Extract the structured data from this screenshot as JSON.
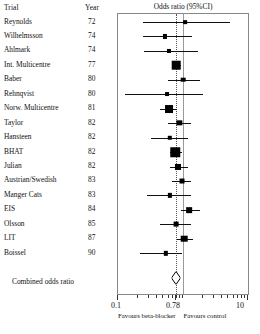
{
  "table": {
    "headers": {
      "trial": "Trial",
      "year": "Year"
    },
    "combined_label": "Combined odds ratio"
  },
  "plot": {
    "title": "Odds ratio  (95%CI)",
    "axis": {
      "scale": "log",
      "min": 0.1,
      "max": 10,
      "tick_labels": [
        "0.1",
        "0.78",
        "10"
      ],
      "tick_values": [
        0.1,
        0.78,
        10
      ],
      "null_line": 1.0,
      "pooled_line": 0.78
    },
    "footnotes": {
      "left": "Favours beta-blocker",
      "right": "Favours control"
    }
  },
  "chart_data": {
    "type": "scatter",
    "title": "Odds ratio  (95%CI)",
    "xlabel": "Odds ratio (95%CI)",
    "ylabel": "Trial",
    "xscale": "log",
    "xlim": [
      0.1,
      10
    ],
    "grid": false,
    "legend": null,
    "xticks": [
      0.1,
      0.78,
      10
    ],
    "xticklabels": [
      "0.1",
      "0.78",
      "10"
    ],
    "reference_lines": [
      {
        "value": 1.0,
        "style": "solid",
        "label": "no effect"
      },
      {
        "value": 0.78,
        "style": "dotted",
        "label": "pooled estimate"
      }
    ],
    "columns": [
      "Trial",
      "Year",
      "Odds ratio",
      "CI low",
      "CI high",
      "Weight"
    ],
    "rows": [
      {
        "trial": "Reynolds",
        "year": "72",
        "or": 1.09,
        "lo": 0.24,
        "hi": 5.2,
        "weight": 0.08
      },
      {
        "trial": "Wilhelmsson",
        "year": "74",
        "or": 0.52,
        "lo": 0.24,
        "hi": 1.4,
        "weight": 0.12
      },
      {
        "trial": "Ahlmark",
        "year": "74",
        "or": 0.6,
        "lo": 0.25,
        "hi": 1.7,
        "weight": 0.12
      },
      {
        "trial": "Int. Multicentre",
        "year": "77",
        "or": 0.78,
        "lo": 0.67,
        "hi": 0.92,
        "weight": 0.62
      },
      {
        "trial": "Baber",
        "year": "80",
        "or": 1.0,
        "lo": 0.58,
        "hi": 1.8,
        "weight": 0.18
      },
      {
        "trial": "Rehnqvist",
        "year": "80",
        "or": 0.56,
        "lo": 0.13,
        "hi": 2.0,
        "weight": 0.1
      },
      {
        "trial": "Norw. Multicentre",
        "year": "81",
        "or": 0.6,
        "lo": 0.44,
        "hi": 0.82,
        "weight": 0.55
      },
      {
        "trial": "Taylor",
        "year": "82",
        "or": 0.88,
        "lo": 0.58,
        "hi": 1.35,
        "weight": 0.26
      },
      {
        "trial": "Hansteen",
        "year": "82",
        "or": 0.62,
        "lo": 0.32,
        "hi": 1.2,
        "weight": 0.16
      },
      {
        "trial": "BHAT",
        "year": "82",
        "or": 0.76,
        "lo": 0.62,
        "hi": 0.95,
        "weight": 0.72
      },
      {
        "trial": "Julian",
        "year": "82",
        "or": 0.84,
        "lo": 0.62,
        "hi": 1.2,
        "weight": 0.34
      },
      {
        "trial": "Austrian/Swedish",
        "year": "83",
        "or": 0.95,
        "lo": 0.68,
        "hi": 1.35,
        "weight": 0.22
      },
      {
        "trial": "Manger Cats",
        "year": "83",
        "or": 0.62,
        "lo": 0.28,
        "hi": 1.35,
        "weight": 0.14
      },
      {
        "trial": "EIS",
        "year": "84",
        "or": 1.25,
        "lo": 0.92,
        "hi": 1.8,
        "weight": 0.3
      },
      {
        "trial": "Olsson",
        "year": "85",
        "or": 0.78,
        "lo": 0.45,
        "hi": 1.35,
        "weight": 0.2
      },
      {
        "trial": "LIT",
        "year": "87",
        "or": 1.05,
        "lo": 0.8,
        "hi": 1.42,
        "weight": 0.4
      },
      {
        "trial": "Boissel",
        "year": "90",
        "or": 0.55,
        "lo": 0.22,
        "hi": 0.95,
        "weight": 0.15
      }
    ],
    "summary": {
      "label": "Combined odds ratio",
      "or": 0.78,
      "lo": 0.71,
      "hi": 0.87,
      "marker": "diamond"
    }
  }
}
